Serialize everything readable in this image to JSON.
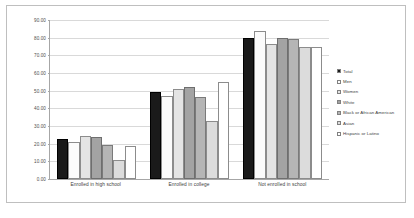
{
  "chart_data": {
    "type": "bar",
    "title": "",
    "xlabel": "",
    "ylabel": "",
    "ylim": [
      0,
      90
    ],
    "ytick_step": 10,
    "ytick_labels": [
      "90.00",
      "80.00",
      "70.00",
      "60.00",
      "50.00",
      "40.00",
      "30.00",
      "20.00",
      "10.00",
      "0.00"
    ],
    "grid": true,
    "legend_position": "right",
    "categories": [
      "Enrolled in high school",
      "Enrolled in college",
      "Not enrolled in school"
    ],
    "series": [
      {
        "name": "Total",
        "color": "#1a1a1a",
        "values": [
          22.5,
          49.5,
          80.0
        ]
      },
      {
        "name": "Men",
        "color": "#fbfbfb",
        "values": [
          21.0,
          47.0,
          84.0
        ]
      },
      {
        "name": "Women",
        "color": "#e4e4e4",
        "values": [
          24.5,
          51.0,
          76.5
        ]
      },
      {
        "name": "White",
        "color": "#a3a3a3",
        "values": [
          24.0,
          52.0,
          80.0
        ]
      },
      {
        "name": "Black or African American",
        "color": "#b5b5b5",
        "values": [
          19.0,
          46.5,
          79.0
        ]
      },
      {
        "name": "Asian",
        "color": "#dcdcdc",
        "values": [
          11.0,
          33.0,
          74.5
        ]
      },
      {
        "name": "Hispanic or Latino",
        "color": "#ffffff",
        "values": [
          18.5,
          55.0,
          75.0
        ]
      }
    ]
  }
}
